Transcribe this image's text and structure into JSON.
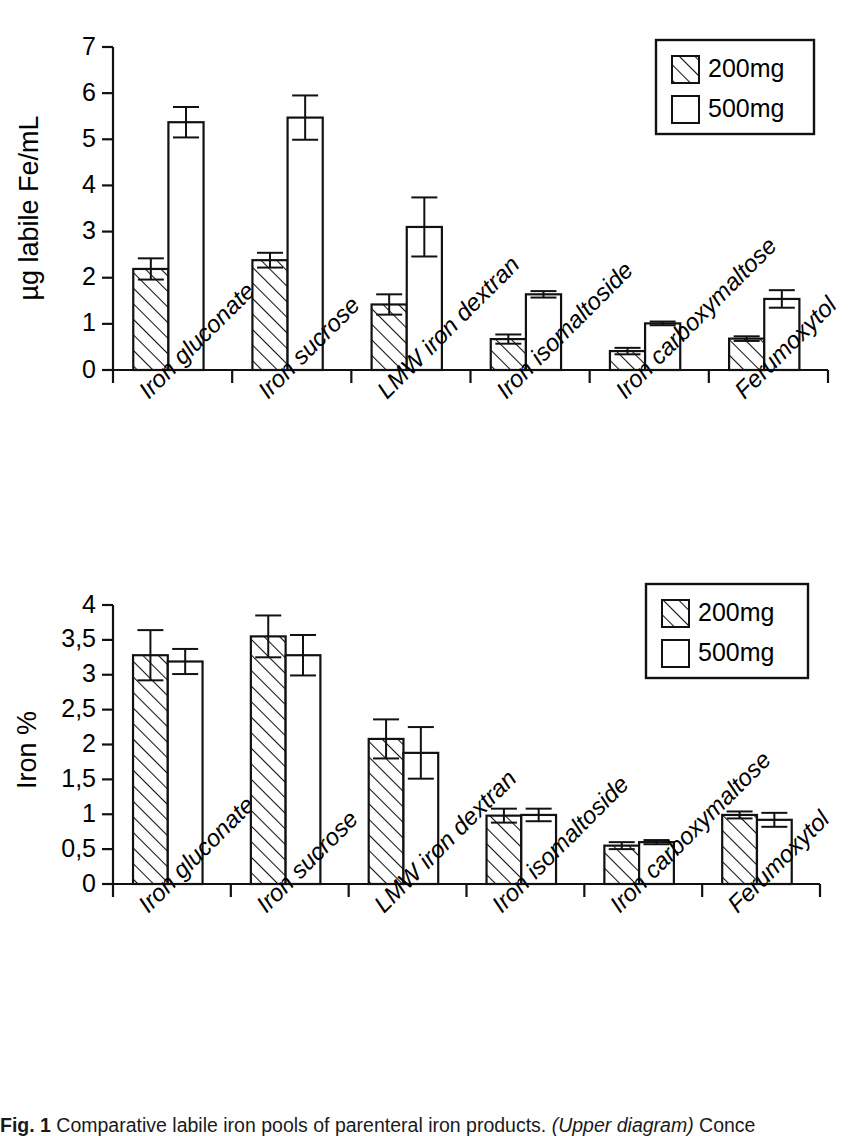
{
  "figure": {
    "caption_prefix": "Fig. 1",
    "caption_text": "Comparative labile iron pools of parenteral iron products. (Upper diagram) Conce",
    "caption_italic": "(Upper diagram)"
  },
  "legend": {
    "items": [
      {
        "label": "200mg",
        "swatch": "hatched-swatch"
      },
      {
        "label": "500mg",
        "swatch": "white-swatch"
      }
    ]
  },
  "chart_data": [
    {
      "id": "upper",
      "type": "bar",
      "title": "",
      "xlabel": "",
      "ylabel": "µg labile Fe/mL",
      "ylim": [
        0,
        7
      ],
      "yticks": [
        0,
        1,
        2,
        3,
        4,
        5,
        6,
        7
      ],
      "ytick_labels": [
        "0",
        "1",
        "2",
        "3",
        "4",
        "5",
        "6",
        "7"
      ],
      "grid": false,
      "legend_position": "top-right",
      "categories": [
        "Iron gluconate",
        "Iron sucrose",
        "LMW iron dextran",
        "Iron isomaltoside",
        "Iron carboxymaltose",
        "Ferumoxytol"
      ],
      "series": [
        {
          "name": "200mg",
          "values": [
            2.19,
            2.38,
            1.42,
            0.67,
            0.41,
            0.68
          ],
          "errors": [
            0.23,
            0.16,
            0.22,
            0.1,
            0.07,
            0.05
          ]
        },
        {
          "name": "500mg",
          "values": [
            5.37,
            5.47,
            3.1,
            1.64,
            1.01,
            1.54
          ],
          "errors": [
            0.33,
            0.48,
            0.64,
            0.07,
            0.04,
            0.19
          ]
        }
      ]
    },
    {
      "id": "lower",
      "type": "bar",
      "title": "",
      "xlabel": "",
      "ylabel": "Iron %",
      "ylim": [
        0,
        4
      ],
      "yticks": [
        0,
        0.5,
        1,
        1.5,
        2,
        2.5,
        3,
        3.5,
        4
      ],
      "ytick_labels": [
        "0",
        "0,5",
        "1",
        "1,5",
        "2",
        "2,5",
        "3",
        "3,5",
        "4"
      ],
      "grid": false,
      "legend_position": "top-right",
      "categories": [
        "Iron gluconate",
        "Iron sucrose",
        "LMW iron dextran",
        "Iron isomaltoside",
        "Iron carboxymaltose",
        "Ferumoxytol"
      ],
      "series": [
        {
          "name": "200mg",
          "values": [
            3.28,
            3.55,
            2.08,
            0.98,
            0.55,
            0.99
          ],
          "errors": [
            0.36,
            0.3,
            0.28,
            0.1,
            0.05,
            0.05
          ]
        },
        {
          "name": "500mg",
          "values": [
            3.19,
            3.28,
            1.88,
            0.99,
            0.6,
            0.92
          ],
          "errors": [
            0.18,
            0.29,
            0.37,
            0.09,
            0.03,
            0.1
          ]
        }
      ]
    }
  ]
}
